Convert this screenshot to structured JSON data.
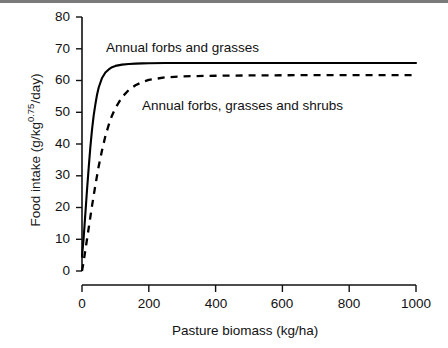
{
  "chart_data": {
    "type": "line",
    "title": "",
    "xlabel": "Pasture biomass (kg/ha)",
    "ylabel_text": "Food intake (g/kg",
    "ylabel_exponent": "0.75",
    "ylabel_tail": "/day)",
    "ylabel_full": "Food intake (g/kg0.75/day)",
    "xlim": [
      0,
      1000
    ],
    "ylim": [
      0,
      80
    ],
    "xticks": [
      0,
      200,
      400,
      600,
      800,
      1000
    ],
    "yticks": [
      0,
      10,
      20,
      30,
      40,
      50,
      60,
      70,
      80
    ],
    "xtick_labels": [
      "0",
      "200",
      "400",
      "600",
      "800",
      "1000"
    ],
    "ytick_labels": [
      "0",
      "10",
      "20",
      "30",
      "40",
      "50",
      "60",
      "70",
      "80"
    ],
    "grid": false,
    "legend_position": "inline-annotations",
    "series": [
      {
        "name": "Annual forbs and grasses",
        "style": "solid",
        "color": "#000000",
        "asymptote": 65.5,
        "x": [
          0,
          5,
          10,
          15,
          20,
          25,
          30,
          35,
          40,
          45,
          50,
          60,
          70,
          80,
          90,
          100,
          120,
          140,
          160,
          180,
          200,
          250,
          300,
          400,
          500,
          600,
          700,
          800,
          900,
          1000
        ],
        "y": [
          4.5,
          10.5,
          18.0,
          25.5,
          32.5,
          39.0,
          44.5,
          49.0,
          52.5,
          55.5,
          57.8,
          60.8,
          62.5,
          63.5,
          64.2,
          64.6,
          65.0,
          65.2,
          65.3,
          65.4,
          65.45,
          65.5,
          65.5,
          65.5,
          65.5,
          65.5,
          65.5,
          65.5,
          65.5,
          65.5
        ]
      },
      {
        "name": "Annual forbs, grasses and shrubs",
        "style": "dashed",
        "color": "#000000",
        "asymptote": 61.7,
        "x": [
          0,
          5,
          10,
          15,
          20,
          25,
          30,
          40,
          50,
          60,
          70,
          80,
          90,
          100,
          120,
          140,
          160,
          180,
          200,
          250,
          300,
          400,
          500,
          600,
          700,
          800,
          900,
          1000
        ],
        "y": [
          0.0,
          3.0,
          6.5,
          10.0,
          13.5,
          17.0,
          20.5,
          27.0,
          33.0,
          38.0,
          42.5,
          46.0,
          49.0,
          51.3,
          54.8,
          57.0,
          58.5,
          59.5,
          60.2,
          61.0,
          61.3,
          61.5,
          61.6,
          61.65,
          61.7,
          61.7,
          61.7,
          61.7
        ]
      }
    ],
    "annotations": [
      {
        "text": "Annual forbs and grasses",
        "x": 110,
        "y": 71
      },
      {
        "text": "Annual forbs, grasses and shrubs",
        "x": 205,
        "y": 53
      }
    ]
  },
  "axes": {
    "x_title": "Pasture biomass (kg/ha)",
    "y_title_main": "Food intake (g/kg",
    "y_title_sup": "0.75",
    "y_title_end": "/day)"
  }
}
